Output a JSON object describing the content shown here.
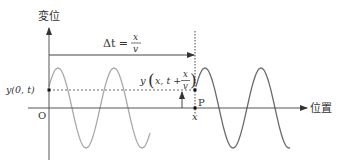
{
  "figure": {
    "y_axis_label": "変位",
    "x_axis_label": "位置",
    "origin_label": "O",
    "left_point_label": "y(0, t)",
    "delta_t": {
      "lhs": "Δt =",
      "numerator": "x",
      "denominator": "v"
    },
    "right_point_label": {
      "prefix": "y",
      "inner": "x, t +",
      "numerator": "x",
      "denominator": "v"
    },
    "point_name": "P",
    "point_x_label": "x"
  },
  "colors": {
    "axis": "#555555",
    "wave_before": "#aaaaaa",
    "wave_after": "#6a6a6a",
    "text": "#333333",
    "background": "#ffffff"
  },
  "waves": {
    "amplitude_px": 40,
    "wavelength_px": 56,
    "before": {
      "x_start": 49,
      "x_end": 150,
      "first_peak_x": 58
    },
    "after": {
      "x_start": 196,
      "x_end": 290,
      "first_peak_x": 205
    }
  }
}
